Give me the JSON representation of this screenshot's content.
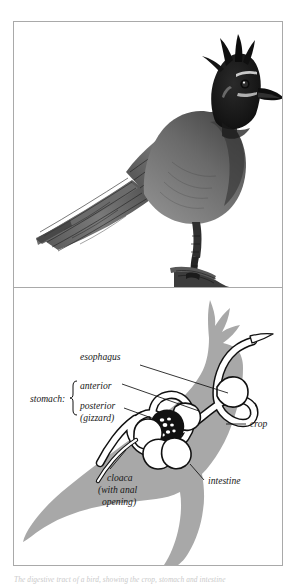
{
  "page": {
    "background_color": "#ffffff",
    "frame_border_color": "#a9a9a9"
  },
  "figure": {
    "panels": [
      {
        "id": "illustration",
        "kind": "halftone-illustration",
        "subject": "crested jay perched on a branch",
        "description": "Grayscale shaded drawing of a crested jay (Steller's Jay) in left profile, perched on a bare twig, with a tall pointed black crest, dark head, pale streaks above and below the eye, a stout pointed bill, barred wing and long barred tail.",
        "ink_color": "#1b1b1b",
        "midtone_color": "#777777"
      },
      {
        "id": "diagram",
        "kind": "anatomical-diagram",
        "subject": "bird digestive tract",
        "description": "Gray silhouette of the same crested jay with the digestive tract drawn as a white tube outlined in black running from the bill through the crop, stomach and intestine to the cloaca.",
        "silhouette_color": "#a8a8a8",
        "tract_fill_color": "#ffffff",
        "tract_outline_color": "#111111",
        "gizzard_color": "#111111",
        "grit_color": "#ffffff"
      }
    ]
  },
  "diagram_labels": {
    "esophagus": "esophagus",
    "crop": "crop",
    "intestine": "intestine",
    "stomach_group": "stomach:",
    "stomach_anterior": "anterior",
    "stomach_posterior_line1": "posterior",
    "stomach_posterior_line2": "(gizzard)",
    "cloaca_line1": "cloaca",
    "cloaca_line2": "(with anal",
    "cloaca_line3": "opening)"
  },
  "caption": {
    "text": "The digestive tract of a bird, showing the crop, stomach and intestine"
  }
}
